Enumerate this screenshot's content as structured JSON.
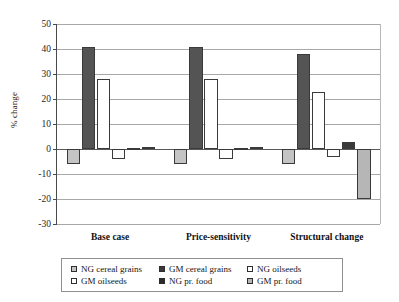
{
  "chart_data": {
    "type": "bar",
    "title": "",
    "xlabel": "",
    "ylabel": "% change",
    "ylim": [
      -30,
      50
    ],
    "ytick_step": 10,
    "yticks": [
      50,
      40,
      30,
      20,
      10,
      0,
      -10,
      -20,
      -30
    ],
    "ytick_labels": [
      "50",
      "40",
      "30",
      "20",
      "10",
      "0",
      "-10",
      "-20",
      "-30"
    ],
    "grid": true,
    "legend_position": "bottom",
    "categories": [
      "Base case",
      "Price-sensitivity",
      "Structural change"
    ],
    "series": [
      {
        "name": "NG cereal grains",
        "color": "#c4c4c4",
        "values": [
          -6,
          -6,
          -6
        ]
      },
      {
        "name": "GM cereal grains",
        "color": "#545454",
        "values": [
          41,
          41,
          38
        ]
      },
      {
        "name": "NG oilseeds",
        "color": "#ffffff",
        "values": [
          28,
          28,
          23
        ]
      },
      {
        "name": "GM oilseeds",
        "color": "#fdfdfd",
        "values": [
          -4,
          -4,
          -3
        ]
      },
      {
        "name": "NG pr. food",
        "color": "#3a3a3a",
        "values": [
          0.3,
          0.3,
          3
        ]
      },
      {
        "name": "GM pr. food",
        "color": "#b6b6b6",
        "values": [
          1,
          1,
          -20
        ]
      }
    ]
  },
  "legend": {
    "items": [
      {
        "label": "NG cereal grains",
        "color": "#c4c4c4"
      },
      {
        "label": "GM cereal grains",
        "color": "#3a3a3a"
      },
      {
        "label": "NG oilseeds",
        "color": "#ffffff"
      },
      {
        "label": "GM oilseeds",
        "color": "#ffffff"
      },
      {
        "label": "NG pr. food",
        "color": "#2b2b2b"
      },
      {
        "label": "GM pr. food",
        "color": "#b6b6b6"
      }
    ]
  }
}
